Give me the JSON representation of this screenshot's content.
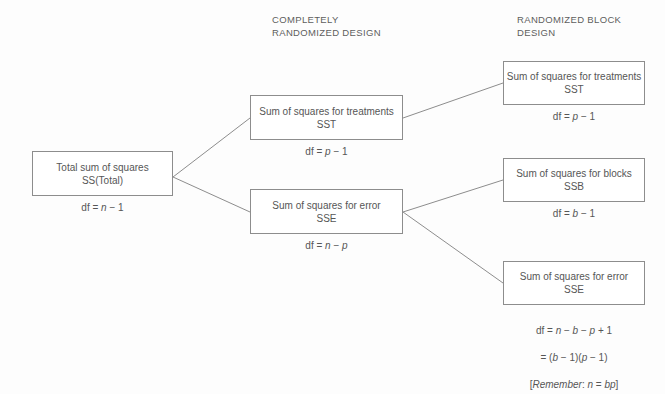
{
  "headers": {
    "completely_randomized": "COMPLETELY\nRANDOMIZED DESIGN",
    "randomized_block": "RANDOMIZED BLOCK\nDESIGN"
  },
  "nodes": {
    "total": {
      "line1": "Total sum of squares",
      "line2": "SS(Total)",
      "df": "df  =  n  −  1"
    },
    "crd_sst": {
      "line1": "Sum of squares for treatments",
      "line2": "SST",
      "df": "df  =  p  −  1"
    },
    "crd_sse": {
      "line1": "Sum of squares for error",
      "line2": "SSE",
      "df": "df  =  n  −  p"
    },
    "rbd_sst": {
      "line1": "Sum of squares for treatments",
      "line2": "SST",
      "df": "df  =  p  −  1"
    },
    "rbd_ssb": {
      "line1": "Sum of squares for blocks",
      "line2": "SSB",
      "df": "df  =  b  −  1"
    },
    "rbd_sse": {
      "line1": "Sum of squares for error",
      "line2": "SSE",
      "df_line1": "df  =  n  −  b  −  p  +  1",
      "df_line2": "=  (b  −  1)(p  −  1)",
      "df_line3": "[Remember:   n  =  bp]"
    }
  },
  "style": {
    "line_color": "#8d8d8d",
    "text_color": "#565656",
    "background": "#fdfdfd"
  }
}
